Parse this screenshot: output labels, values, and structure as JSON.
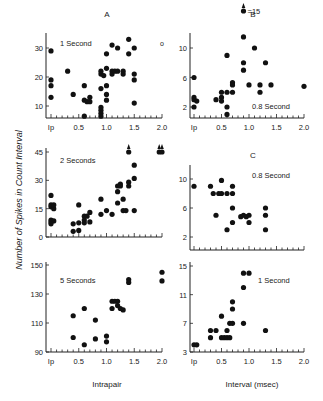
{
  "figure": {
    "ylabel": "Number of Spikes in Count Interval",
    "xlabel_left": "Intrapair",
    "xlabel_right": "Interval (msec)"
  },
  "chart_data": [
    {
      "id": "A-1s",
      "type": "scatter",
      "panel_letter": "A",
      "title": "1 Second",
      "xlabel": "Intrapair Interval (msec)",
      "ylabel": "Number of Spikes in Count Interval",
      "xticks": [
        "Ip",
        "0.5",
        "1.0",
        "1.5",
        "2.0"
      ],
      "yticks": [
        10,
        20,
        30
      ],
      "ylim": [
        6,
        34
      ],
      "extra_marker": "o",
      "points": [
        [
          0,
          29
        ],
        [
          0,
          19
        ],
        [
          0,
          17
        ],
        [
          0,
          13
        ],
        [
          0.3,
          22
        ],
        [
          0.4,
          14
        ],
        [
          0.6,
          17
        ],
        [
          0.6,
          12
        ],
        [
          0.6,
          6.5
        ],
        [
          0.65,
          11.5
        ],
        [
          0.7,
          13
        ],
        [
          0.7,
          11.5
        ],
        [
          0.9,
          16
        ],
        [
          0.9,
          9.5
        ],
        [
          0.9,
          8.5
        ],
        [
          0.9,
          7.5
        ],
        [
          0.9,
          6.5
        ],
        [
          0.9,
          21
        ],
        [
          0.9,
          22
        ],
        [
          0.95,
          20.5
        ],
        [
          1.0,
          28
        ],
        [
          1.0,
          23
        ],
        [
          1.0,
          17
        ],
        [
          1.0,
          14
        ],
        [
          1.0,
          12
        ],
        [
          1.1,
          31
        ],
        [
          1.1,
          22
        ],
        [
          1.1,
          21
        ],
        [
          1.15,
          22
        ],
        [
          1.2,
          30
        ],
        [
          1.2,
          22
        ],
        [
          1.3,
          22
        ],
        [
          1.3,
          21
        ],
        [
          1.4,
          33
        ],
        [
          1.4,
          28
        ],
        [
          1.5,
          30
        ],
        [
          1.5,
          21
        ],
        [
          1.5,
          19
        ],
        [
          1.5,
          11
        ]
      ]
    },
    {
      "id": "B-0.8s",
      "type": "scatter",
      "panel_letter": "B",
      "title": "0.8 Second",
      "xlabel": "Interval (msec)",
      "ylabel": "Number of Spikes in Count Interval",
      "xticks": [
        "Ip",
        "0.5",
        "1.0",
        "1.5",
        "2.0"
      ],
      "yticks": [
        2,
        6,
        10
      ],
      "ylim": [
        0.5,
        11.5
      ],
      "annotation": "=15",
      "off_scale": [
        [
          0.9,
          15
        ]
      ],
      "points": [
        [
          0,
          6
        ],
        [
          0,
          3.3
        ],
        [
          0,
          3
        ],
        [
          0.05,
          2.8
        ],
        [
          0,
          2
        ],
        [
          0.4,
          3
        ],
        [
          0.5,
          4
        ],
        [
          0.5,
          3.3
        ],
        [
          0.5,
          2.8
        ],
        [
          0.6,
          9
        ],
        [
          0.6,
          4
        ],
        [
          0.6,
          2
        ],
        [
          0.6,
          1
        ],
        [
          0.7,
          5.3
        ],
        [
          0.7,
          5
        ],
        [
          0.7,
          4
        ],
        [
          0.9,
          11.5
        ],
        [
          0.9,
          8
        ],
        [
          0.9,
          7
        ],
        [
          1.0,
          5
        ],
        [
          1.1,
          10
        ],
        [
          1.2,
          5
        ],
        [
          1.2,
          4
        ],
        [
          1.3,
          8
        ],
        [
          1.4,
          5
        ],
        [
          2.0,
          4.8
        ]
      ]
    },
    {
      "id": "A-2s",
      "type": "scatter",
      "title": "2 Seconds",
      "xlabel": "Intrapair Interval (msec)",
      "ylabel": "Number of Spikes in Count Interval",
      "xticks": [
        "Ip",
        "0.5",
        "1.0",
        "1.5",
        "2.0"
      ],
      "yticks": [
        0,
        15,
        30,
        45
      ],
      "ylim": [
        0,
        48
      ],
      "off_scale": [
        [
          1.4,
          45
        ],
        [
          1.95,
          45
        ],
        [
          2.0,
          45
        ]
      ],
      "points": [
        [
          0,
          22
        ],
        [
          0,
          17
        ],
        [
          0,
          16
        ],
        [
          0.05,
          15
        ],
        [
          0.05,
          17
        ],
        [
          0,
          9
        ],
        [
          0,
          8
        ],
        [
          0.05,
          8.5
        ],
        [
          0,
          7
        ],
        [
          0.4,
          7
        ],
        [
          0.4,
          3
        ],
        [
          0.5,
          7.5
        ],
        [
          0.5,
          3.5
        ],
        [
          0.5,
          17
        ],
        [
          0.6,
          11
        ],
        [
          0.6,
          9
        ],
        [
          0.6,
          7.5
        ],
        [
          0.65,
          11
        ],
        [
          0.7,
          13
        ],
        [
          0.7,
          8
        ],
        [
          0.9,
          20
        ],
        [
          0.9,
          12
        ],
        [
          1.0,
          14
        ],
        [
          1.1,
          12
        ],
        [
          1.2,
          27
        ],
        [
          1.2,
          24
        ],
        [
          1.2,
          18
        ],
        [
          1.25,
          28
        ],
        [
          1.25,
          27
        ],
        [
          1.3,
          20
        ],
        [
          1.3,
          14
        ],
        [
          1.35,
          14
        ],
        [
          1.4,
          29
        ],
        [
          1.4,
          27
        ],
        [
          1.5,
          38
        ],
        [
          1.5,
          31
        ],
        [
          1.5,
          14
        ]
      ]
    },
    {
      "id": "C-0.8s",
      "type": "scatter",
      "panel_letter": "C",
      "title": "0.8 Second",
      "xlabel": "Interval (msec)",
      "ylabel": "Number of Spikes in Count Interval",
      "xticks": [
        "Ip",
        "0.5",
        "1.0",
        "1.5",
        "2.0"
      ],
      "yticks": [
        2,
        6,
        10
      ],
      "ylim": [
        0.5,
        11.5
      ],
      "points": [
        [
          0,
          9
        ],
        [
          0.3,
          9
        ],
        [
          0.35,
          8
        ],
        [
          0.4,
          5
        ],
        [
          0.45,
          8
        ],
        [
          0.5,
          9.8
        ],
        [
          0.5,
          8
        ],
        [
          0.6,
          8
        ],
        [
          0.6,
          3
        ],
        [
          0.7,
          9
        ],
        [
          0.7,
          8
        ],
        [
          0.7,
          6
        ],
        [
          0.7,
          4
        ],
        [
          0.85,
          4.8
        ],
        [
          0.9,
          5
        ],
        [
          0.95,
          4.8
        ],
        [
          1.0,
          5
        ],
        [
          1.0,
          4
        ],
        [
          1.3,
          6
        ],
        [
          1.3,
          5
        ],
        [
          1.3,
          3
        ]
      ]
    },
    {
      "id": "A-5s",
      "type": "scatter",
      "title": "5 Seconds",
      "xlabel": "Intrapair Interval (msec)",
      "ylabel": "Number of Spikes in Count Interval",
      "xticks": [
        "Ip",
        "0.5",
        "1.0",
        "1.5",
        "2.0"
      ],
      "yticks": [
        90,
        110,
        130,
        150
      ],
      "ylim": [
        90,
        150
      ],
      "points": [
        [
          0.4,
          115
        ],
        [
          0.4,
          100
        ],
        [
          0.6,
          120
        ],
        [
          0.6,
          95
        ],
        [
          0.8,
          112
        ],
        [
          0.8,
          99
        ],
        [
          1.0,
          101
        ],
        [
          1.0,
          97
        ],
        [
          1.1,
          125
        ],
        [
          1.1,
          120
        ],
        [
          1.15,
          125
        ],
        [
          1.2,
          125
        ],
        [
          1.2,
          122
        ],
        [
          1.25,
          120
        ],
        [
          1.3,
          119
        ],
        [
          1.4,
          140
        ],
        [
          1.4,
          138
        ],
        [
          2.0,
          145
        ],
        [
          2.0,
          139
        ]
      ]
    },
    {
      "id": "C-1s",
      "type": "scatter",
      "title": "1 Second",
      "xlabel": "Interval (msec)",
      "ylabel": "Number of Spikes in Count Interval",
      "xticks": [
        "Ip",
        "0.5",
        "1.0",
        "1.5",
        "2.0"
      ],
      "yticks": [
        3,
        7,
        11,
        15
      ],
      "ylim": [
        3,
        15
      ],
      "points": [
        [
          0,
          4
        ],
        [
          0.05,
          4
        ],
        [
          0.3,
          6
        ],
        [
          0.3,
          5
        ],
        [
          0.4,
          6
        ],
        [
          0.5,
          8
        ],
        [
          0.5,
          5
        ],
        [
          0.55,
          5
        ],
        [
          0.6,
          6
        ],
        [
          0.6,
          5
        ],
        [
          0.65,
          5
        ],
        [
          0.65,
          7
        ],
        [
          0.7,
          10
        ],
        [
          0.7,
          9
        ],
        [
          0.7,
          7
        ],
        [
          0.9,
          14
        ],
        [
          0.9,
          12
        ],
        [
          0.9,
          7
        ],
        [
          1.0,
          14
        ],
        [
          1.3,
          6
        ]
      ]
    }
  ]
}
